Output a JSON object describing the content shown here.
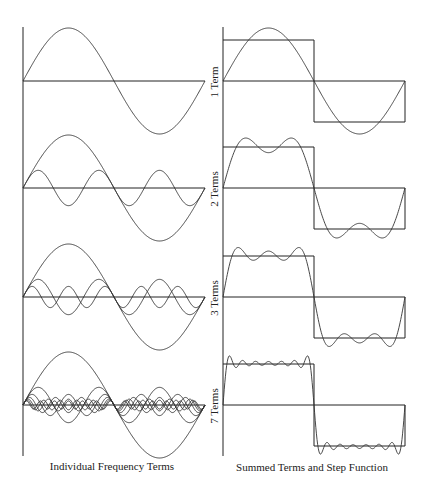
{
  "columns": {
    "left_caption": "Individual Frequency Terms",
    "right_caption": "Summed Terms and Step Function"
  },
  "rows": [
    {
      "label": "1 Term",
      "terms": 1
    },
    {
      "label": "2 Terms",
      "terms": 2
    },
    {
      "label": "3 Terms",
      "terms": 3
    },
    {
      "label": "7 Terms",
      "terms": 7
    }
  ],
  "colors": {
    "line": "#333333",
    "axis": "#222222",
    "background": "#ffffff"
  }
}
